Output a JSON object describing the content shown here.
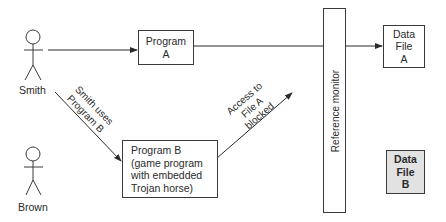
{
  "actors": [
    {
      "id": "smith",
      "label": "Smith"
    },
    {
      "id": "brown",
      "label": "Brown"
    }
  ],
  "program_a": {
    "lines": [
      "Program",
      "A"
    ]
  },
  "program_b": {
    "lines": [
      "Program B",
      "(game program",
      "with embedded",
      "Trojan horse)"
    ]
  },
  "reference_monitor": {
    "label": "Reference monitor"
  },
  "data_file_a": {
    "lines": [
      "Data",
      "File",
      "A"
    ]
  },
  "data_file_b": {
    "lines": [
      "Data",
      "File",
      "B"
    ],
    "fill": "#e2e2e2"
  },
  "edges": {
    "smith_uses_b": {
      "lines": [
        "Smith uses",
        "Program B"
      ]
    },
    "access_blocked": {
      "lines": [
        "Access to",
        "File A",
        "blocked"
      ]
    }
  },
  "colors": {
    "stroke": "#3a3a3a",
    "text": "#2a2a2a",
    "background": "#ffffff"
  }
}
